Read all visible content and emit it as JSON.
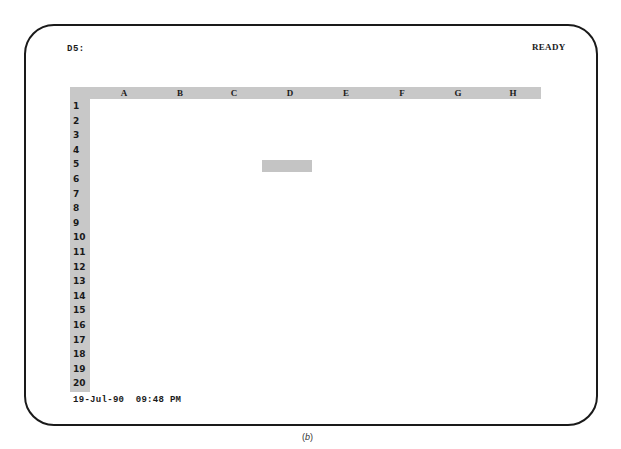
{
  "control_panel": {
    "cell_address": "D5:",
    "mode": "READY"
  },
  "worksheet": {
    "columns": [
      "A",
      "B",
      "C",
      "D",
      "E",
      "F",
      "G",
      "H"
    ],
    "rows": [
      "1",
      "2",
      "3",
      "4",
      "5",
      "6",
      "7",
      "8",
      "9",
      "10",
      "11",
      "12",
      "13",
      "14",
      "15",
      "16",
      "17",
      "18",
      "19",
      "20"
    ],
    "active_cell": {
      "column": "D",
      "row": "5"
    },
    "cells": {}
  },
  "status_line": {
    "date": "19-Jul-90",
    "time": "09:48 PM"
  },
  "figure_caption": {
    "open": "(",
    "letter": "b",
    "close": ")"
  },
  "colors": {
    "frame": "#1a1a1a",
    "header_fill": "#c8c8c8",
    "cursor_fill": "#c4c4c4",
    "background": "#ffffff"
  }
}
